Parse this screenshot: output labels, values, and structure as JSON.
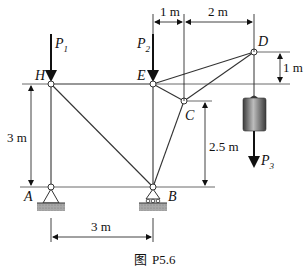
{
  "figure": {
    "caption_prefix": "图",
    "caption_id": "P5.6"
  },
  "nodes": {
    "H": "H",
    "E": "E",
    "C": "C",
    "D": "D",
    "A": "A",
    "B": "B"
  },
  "loads": {
    "p1": {
      "symbol": "P",
      "sub": "1"
    },
    "p2": {
      "symbol": "P",
      "sub": "2"
    },
    "p3": {
      "symbol": "P",
      "sub": "3"
    }
  },
  "dimensions": {
    "top_left": "1 m",
    "top_right": "2 m",
    "right_vertical": "1 m",
    "c_height": "2.5 m",
    "left_height": "3 m",
    "bottom_span": "3 m"
  },
  "colors": {
    "member": "#333333",
    "support_fill": "#9a9a9a",
    "weight_dark": "#3a3a3a",
    "weight_light": "#bdbdbd"
  }
}
